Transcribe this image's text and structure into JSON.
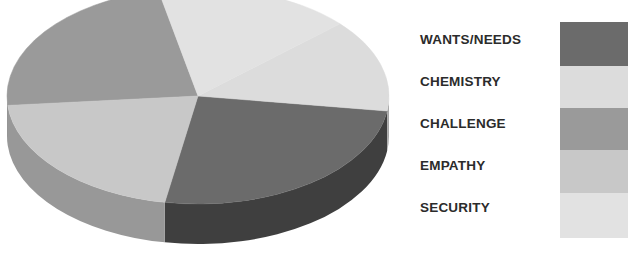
{
  "chart_data": {
    "type": "pie",
    "title": "",
    "three_d": true,
    "legend_position": "right",
    "categories": [
      "WANTS/NEEDS",
      "CHEMISTRY",
      "CHALLENGE",
      "EMPATHY",
      "SECURITY"
    ],
    "values": [
      20,
      20,
      20,
      20,
      20
    ],
    "value_unit": "percent",
    "colors": [
      "#6b6b6b",
      "#dcdcdc",
      "#9a9a9a",
      "#c8c8c8",
      "#e2e2e2"
    ],
    "side_colors": [
      "#3f3f3f",
      "#a8a8a8",
      "#6d6d6d",
      "#989898",
      "#b4b4b4"
    ],
    "slices": [
      {
        "label": "WANTS/NEEDS",
        "value": 20,
        "color": "#6b6b6b",
        "start_angle_deg": 8,
        "end_angle_deg": 100
      },
      {
        "label": "CHEMISTRY",
        "value": 20,
        "color": "#dcdcdc",
        "start_angle_deg": 318,
        "end_angle_deg": 8
      },
      {
        "label": "CHALLENGE",
        "value": 20,
        "color": "#9a9a9a",
        "start_angle_deg": 175,
        "end_angle_deg": 258
      },
      {
        "label": "EMPATHY",
        "value": 20,
        "color": "#c8c8c8",
        "start_angle_deg": 100,
        "end_angle_deg": 175
      },
      {
        "label": "SECURITY",
        "value": 20,
        "color": "#e2e2e2",
        "start_angle_deg": 258,
        "end_angle_deg": 318
      }
    ],
    "xlabel": "",
    "ylabel": "",
    "grid": false
  },
  "legend": {
    "items": [
      {
        "label": "WANTS/NEEDS",
        "color": "#6b6b6b"
      },
      {
        "label": "CHEMISTRY",
        "color": "#dcdcdc"
      },
      {
        "label": "CHALLENGE",
        "color": "#9a9a9a"
      },
      {
        "label": "EMPATHY",
        "color": "#c8c8c8"
      },
      {
        "label": "SECURITY",
        "color": "#e2e2e2"
      }
    ]
  },
  "colors": {
    "background": "#ffffff",
    "text": "#2b2b2b"
  }
}
